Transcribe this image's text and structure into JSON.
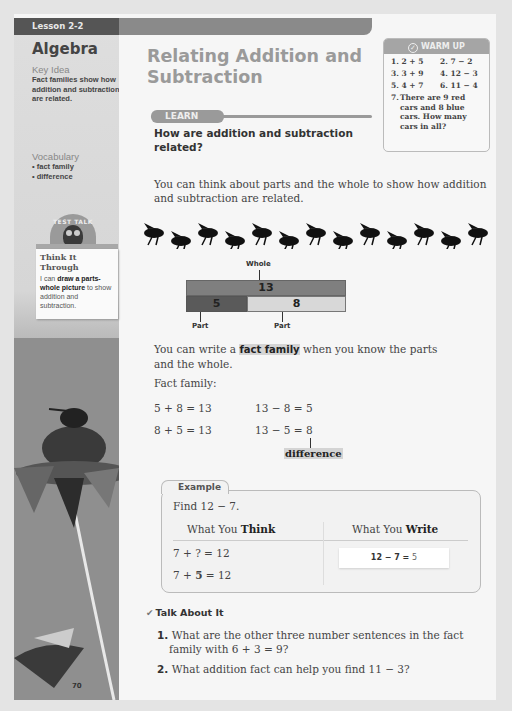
{
  "sidebar": {
    "lesson_label": "Lesson 2-2",
    "strand": "Algebra",
    "key_idea_heading": "Key Idea",
    "key_idea_text": "Fact families show how addition and subtraction are related.",
    "vocabulary_heading": "Vocabulary",
    "vocabulary": [
      "• fact family",
      "• difference"
    ],
    "test_talk": {
      "badge": "TEST TALK",
      "title": "Think It Through",
      "pre": "I can ",
      "bold": "draw a parts-whole picture",
      "post": " to show addition and subtraction."
    },
    "page_number": "70"
  },
  "main": {
    "title": "Relating Addition and Subtraction",
    "learn_label": "LEARN",
    "question": "How are addition and subtraction related?",
    "intro": "You can think about parts and the whole to show how addition and subtraction are related.",
    "bee_count": 13,
    "bar_model": {
      "whole_label": "Whole",
      "whole_value": "13",
      "part1_value": "5",
      "part2_value": "8",
      "part_label": "Part"
    },
    "fact_family_sentence": {
      "pre": "You can write a ",
      "bold": "fact family",
      "post": " when you know the parts and the whole."
    },
    "fact_family_label": "Fact family:",
    "fact_family": {
      "add1": "5 + 8 = 13",
      "add2": "8 + 5 = 13",
      "sub1": "13 − 8 = 5",
      "sub2": "13 − 5 = 8"
    },
    "difference_label": "difference",
    "example": {
      "tab": "Example",
      "prompt": "Find 12 − 7.",
      "think_header_pre": "What You ",
      "think_header_bold": "Think",
      "write_header_pre": "What You ",
      "write_header_bold": "Write",
      "think_line1": "7 + ? = 12",
      "think_line2_pre": "7 + ",
      "think_line2_bold": "5",
      "think_line2_post": " = 12",
      "write_eq": "12 − 7 = ",
      "write_ans": "5"
    },
    "talk": {
      "heading": "Talk About It",
      "items": [
        {
          "num": "1.",
          "line1": " What are the other three number sentences in the fact",
          "line2": "family with 6 + 3 = 9?"
        },
        {
          "num": "2.",
          "line1": " What addition fact can help you find 11 − 3?"
        }
      ]
    }
  },
  "warmup": {
    "heading": "WARM UP",
    "problems": [
      "1. 2 + 5",
      "2. 7 − 2",
      "3. 3 + 9",
      "4. 12 − 3",
      "5. 4 + 7",
      "6. 11 − 4"
    ],
    "word_problem_num": "7.",
    "word_problem": "There are 9 red cars and 8 blue cars. How many cars in all?"
  },
  "colors": {
    "page_bg": "#f6f6f6",
    "lesson_tab": "#555555",
    "accent_gray": "#9a9a9a",
    "bar_whole": "#7f7f7f",
    "bar_part1": "#5a5a5a",
    "bar_part2": "#d8d8d8"
  }
}
